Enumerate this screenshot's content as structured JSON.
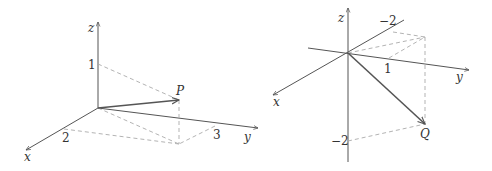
{
  "figure": {
    "left_panel": {
      "axes": {
        "x_label": "x",
        "y_label": "y",
        "z_label": "z"
      },
      "ticks": {
        "x": "2",
        "y": "3",
        "z": "1"
      },
      "point_label": "P"
    },
    "right_panel": {
      "axes": {
        "x_label": "x",
        "y_label": "y",
        "z_label": "z"
      },
      "ticks": {
        "x": "−2",
        "y": "1",
        "z": "−2"
      },
      "point_label": "Q"
    },
    "colors": {
      "axis": "#555555",
      "vector": "#555555",
      "dashed": "#aaaaaa",
      "text": "#333333"
    }
  }
}
